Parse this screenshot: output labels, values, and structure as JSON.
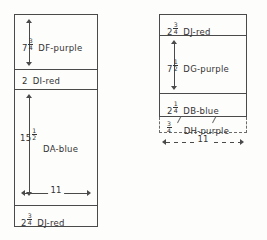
{
  "diagram": {
    "panels": [
      {
        "id": "left-panel",
        "name": "left-cut-layout",
        "overall_width": "11",
        "sections": [
          {
            "id": "df-purple",
            "dimension_whole": "7",
            "dimension_num": "3",
            "dimension_den": "4",
            "dimension_text": "7 3/4",
            "label": "DF-purple",
            "has_vertical_arrow": true
          },
          {
            "id": "di-red",
            "dimension_whole": "2",
            "dimension_num": "",
            "dimension_den": "",
            "dimension_text": "2",
            "label": "DI-red",
            "has_vertical_arrow": false
          },
          {
            "id": "da-blue",
            "dimension_whole": "15",
            "dimension_num": "1",
            "dimension_den": "2",
            "dimension_text": "15 1/2",
            "label": "DA-blue",
            "has_vertical_arrow": true
          },
          {
            "id": "dj-red",
            "dimension_whole": "2",
            "dimension_num": "3",
            "dimension_den": "4",
            "dimension_text": "2 3/4",
            "label": "DJ-red",
            "has_vertical_arrow": false
          }
        ]
      },
      {
        "id": "right-panel",
        "name": "right-cut-layout",
        "overall_width": "11",
        "sections": [
          {
            "id": "dj-red-2",
            "dimension_whole": "2",
            "dimension_num": "3",
            "dimension_den": "4",
            "dimension_text": "2 3/4",
            "label": "DJ-red",
            "has_vertical_arrow": false
          },
          {
            "id": "dg-purple",
            "dimension_whole": "7",
            "dimension_num": "1",
            "dimension_den": "2",
            "dimension_text": "7 1/2",
            "label": "DG-purple",
            "has_vertical_arrow": true
          },
          {
            "id": "db-blue",
            "dimension_whole": "2",
            "dimension_num": "1",
            "dimension_den": "4",
            "dimension_text": "2 1/4",
            "label": "DB-blue",
            "has_vertical_arrow": false
          },
          {
            "id": "dh-purple",
            "dimension_whole": "",
            "dimension_num": "3",
            "dimension_den": "4",
            "dimension_text": "3/4",
            "label": "DH-purple",
            "has_vertical_arrow": false,
            "dashed": true
          }
        ]
      }
    ],
    "ink_color": "#4a4a4a",
    "text_color": "#333333",
    "background": "#fdfdfc"
  }
}
